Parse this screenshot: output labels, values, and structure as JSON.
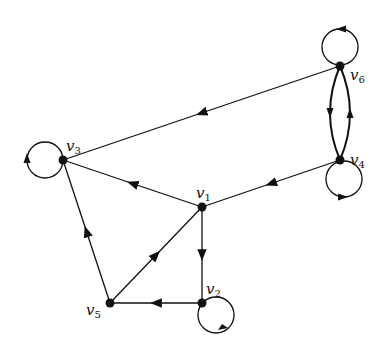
{
  "graph": {
    "type": "directed",
    "nodes": [
      {
        "id": "v1",
        "label": "v",
        "sub": "1",
        "x": 202,
        "y": 207,
        "lx": 196,
        "ly": 198
      },
      {
        "id": "v2",
        "label": "v",
        "sub": "2",
        "x": 202,
        "y": 303,
        "lx": 206,
        "ly": 294
      },
      {
        "id": "v3",
        "label": "v",
        "sub": "3",
        "x": 63,
        "y": 160,
        "lx": 66,
        "ly": 151
      },
      {
        "id": "v4",
        "label": "v",
        "sub": "4",
        "x": 340,
        "y": 160,
        "lx": 350,
        "ly": 165
      },
      {
        "id": "v5",
        "label": "v",
        "sub": "5",
        "x": 110,
        "y": 303,
        "lx": 86,
        "ly": 315
      },
      {
        "id": "v6",
        "label": "v",
        "sub": "6",
        "x": 340,
        "y": 66,
        "lx": 350,
        "ly": 80
      }
    ],
    "edges": [
      {
        "from": "v6",
        "to": "v3"
      },
      {
        "from": "v1",
        "to": "v3"
      },
      {
        "from": "v4",
        "to": "v1"
      },
      {
        "from": "v1",
        "to": "v2"
      },
      {
        "from": "v2",
        "to": "v5"
      },
      {
        "from": "v5",
        "to": "v1"
      },
      {
        "from": "v5",
        "to": "v3"
      },
      {
        "from": "v6",
        "to": "v4",
        "curve": "left"
      },
      {
        "from": "v4",
        "to": "v6",
        "curve": "right"
      }
    ],
    "loops": [
      "v2",
      "v3",
      "v4",
      "v6"
    ]
  }
}
